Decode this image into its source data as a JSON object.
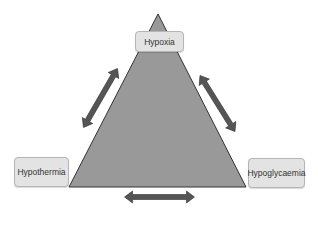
{
  "diagram": {
    "type": "triangle",
    "nodes": {
      "top": "Hypoxia",
      "left": "Hypothermia",
      "right": "Hypoglycaemia"
    },
    "edges": [
      {
        "from": "Hypothermia",
        "to": "Hypoxia",
        "style": "double-arrow"
      },
      {
        "from": "Hypoxia",
        "to": "Hypoglycaemia",
        "style": "double-arrow"
      },
      {
        "from": "Hypothermia",
        "to": "Hypoglycaemia",
        "style": "double-arrow"
      }
    ],
    "colors": {
      "triangle_fill": "#999999",
      "arrow_fill": "#555555",
      "label_bg": "#e3e3e3"
    }
  }
}
